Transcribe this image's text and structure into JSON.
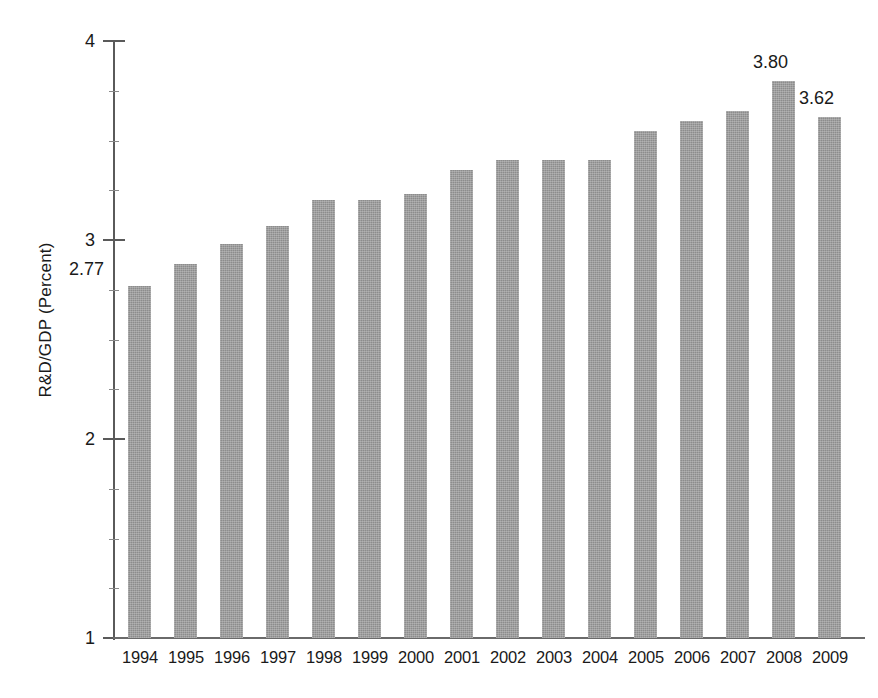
{
  "chart_data": {
    "type": "bar",
    "title": "",
    "subtitle": "",
    "xlabel": "",
    "ylabel": "R&D/GDP (Percent)",
    "categories": [
      "1994",
      "1995",
      "1996",
      "1997",
      "1998",
      "1999",
      "2000",
      "2001",
      "2002",
      "2003",
      "2004",
      "2005",
      "2006",
      "2007",
      "2008",
      "2009"
    ],
    "values": [
      2.77,
      2.88,
      2.98,
      3.07,
      3.2,
      3.2,
      3.23,
      3.35,
      3.4,
      3.4,
      3.4,
      3.55,
      3.6,
      3.65,
      3.8,
      3.62
    ],
    "ylim": [
      1,
      4
    ],
    "ytick_labels": [
      "1",
      "2",
      "3",
      "4"
    ],
    "ytick_values": [
      1,
      2,
      3,
      4
    ],
    "minor_ticks": [
      1.25,
      1.5,
      1.75,
      2.25,
      2.5,
      2.75,
      3.25,
      3.5,
      3.75
    ],
    "grid": false,
    "legend": null,
    "legend_position": "none",
    "bar_color": "#8c8c8c",
    "axis_color": "#5a5a5a",
    "annotations": [
      {
        "category": "1994",
        "text": "2.77",
        "placement": "left-of-bar-top"
      },
      {
        "category": "2008",
        "text": "3.80",
        "placement": "above-bar"
      },
      {
        "category": "2009",
        "text": "3.62",
        "placement": "above-bar"
      }
    ]
  }
}
